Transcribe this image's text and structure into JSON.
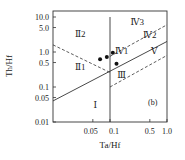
{
  "chart_data": {
    "type": "scatter",
    "title": "",
    "panel_label": "(b)",
    "xlabel": "Ta/Hf",
    "ylabel": "Th/Hf",
    "xscale": "log",
    "yscale": "log",
    "xlim": [
      0.01,
      1.0
    ],
    "ylim": [
      0.01,
      10.0
    ],
    "grid": false,
    "legend": null,
    "x_ticks": [
      {
        "value": 0.05,
        "label": "0.05"
      },
      {
        "value": 0.1,
        "label": "0.1"
      },
      {
        "value": 0.5,
        "label": "0.5"
      },
      {
        "value": 1.0,
        "label": "1.0"
      }
    ],
    "y_ticks": [
      {
        "value": 10.0,
        "label": "10.0"
      },
      {
        "value": 5.0,
        "label": "5.0"
      },
      {
        "value": 1.0,
        "label": "1.0"
      },
      {
        "value": 0.5,
        "label": "0.5"
      },
      {
        "value": 0.1,
        "label": "0.1"
      },
      {
        "value": 0.05,
        "label": "0.05"
      },
      {
        "value": 0.01,
        "label": "0.01"
      }
    ],
    "points": [
      {
        "x": 0.067,
        "y": 0.62
      },
      {
        "x": 0.088,
        "y": 0.72
      },
      {
        "x": 0.112,
        "y": 0.95
      },
      {
        "x": 0.13,
        "y": 0.46
      }
    ],
    "boundary_lines": [
      {
        "style": "solid",
        "from": [
          0.01,
          0.04
        ],
        "to": [
          1.0,
          2.0
        ]
      },
      {
        "style": "solid-vertical",
        "from": [
          0.1,
          0.01
        ],
        "to": [
          0.1,
          10.0
        ]
      },
      {
        "style": "dashed",
        "from": [
          0.01,
          1.6
        ],
        "to": [
          0.1,
          0.26
        ]
      },
      {
        "style": "dashed",
        "from": [
          0.1,
          0.75
        ],
        "to": [
          1.0,
          6.0
        ]
      },
      {
        "style": "dashed",
        "from": [
          0.1,
          0.1
        ],
        "to": [
          1.0,
          0.8
        ]
      }
    ],
    "regions": [
      {
        "label": "Ⅰ",
        "x": 0.055,
        "y": 0.025
      },
      {
        "label": "Ⅱ1",
        "x": 0.03,
        "y": 0.3
      },
      {
        "label": "Ⅱ2",
        "x": 0.03,
        "y": 2.6
      },
      {
        "label": "Ⅲ",
        "x": 0.16,
        "y": 0.18
      },
      {
        "label": "Ⅳ1",
        "x": 0.16,
        "y": 0.9
      },
      {
        "label": "Ⅳ2",
        "x": 0.5,
        "y": 2.5
      },
      {
        "label": "Ⅳ3",
        "x": 0.3,
        "y": 6.0
      },
      {
        "label": "Ⅴ",
        "x": 0.6,
        "y": 0.9
      }
    ]
  }
}
